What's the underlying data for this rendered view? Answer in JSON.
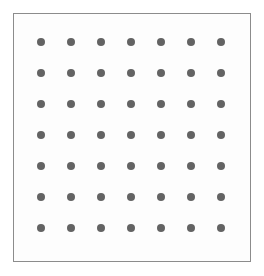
{
  "canvas": {
    "width": 264,
    "height": 276,
    "background": "#ffffff"
  },
  "panel": {
    "name": "dot-grid-panel",
    "left": 13,
    "top": 13,
    "width": 238,
    "height": 249,
    "border_width": 1,
    "border_color": "#8c8c8c",
    "fill_color": "#fdfdfd"
  },
  "chart_data": {
    "type": "scatter",
    "title": "",
    "subtitle": "",
    "xlabel": "",
    "ylabel": "",
    "grid": false,
    "legend": null,
    "legend_position": "none",
    "rows": 7,
    "columns": 7,
    "point_count": 49,
    "marker": {
      "shape": "circle",
      "diameter_px": 8,
      "color": "#636363"
    },
    "x_spacing_px": 30,
    "y_spacing_px": 31,
    "xlim": [
      0,
      264
    ],
    "ylim": [
      0,
      276
    ],
    "x_tick_labels": [],
    "y_tick_labels": [],
    "x": [
      41,
      71,
      101,
      131,
      161,
      191,
      221,
      41,
      71,
      101,
      131,
      161,
      191,
      221,
      41,
      71,
      101,
      131,
      161,
      191,
      221,
      41,
      71,
      101,
      131,
      161,
      191,
      221,
      41,
      71,
      101,
      131,
      161,
      191,
      221,
      41,
      71,
      101,
      131,
      161,
      191,
      221,
      41,
      71,
      101,
      131,
      161,
      191,
      221
    ],
    "y": [
      42,
      42,
      42,
      42,
      42,
      42,
      42,
      73,
      73,
      73,
      73,
      73,
      73,
      73,
      104,
      104,
      104,
      104,
      104,
      104,
      104,
      135,
      135,
      135,
      135,
      135,
      135,
      135,
      166,
      166,
      166,
      166,
      166,
      166,
      166,
      197,
      197,
      197,
      197,
      197,
      197,
      197,
      228,
      228,
      228,
      228,
      228,
      228,
      228
    ],
    "column_centers_px": [
      41,
      71,
      101,
      131,
      161,
      191,
      221
    ],
    "row_centers_px": [
      42,
      73,
      104,
      135,
      166,
      197,
      228
    ],
    "annotations": []
  }
}
